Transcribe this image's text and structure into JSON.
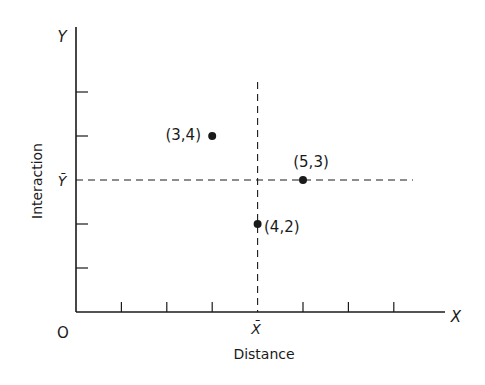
{
  "chart_data": {
    "type": "scatter",
    "title": "",
    "xlabel": "Distance",
    "ylabel": "Interaction",
    "x_axis_symbol": "X",
    "y_axis_symbol": "Y",
    "origin_label": "O",
    "x_mean_label": "X̄",
    "y_mean_label": "Ȳ",
    "x_mean": 4,
    "y_mean": 3,
    "x_ticks": [
      1,
      2,
      3,
      4,
      5,
      6,
      7
    ],
    "y_ticks": [
      1,
      2,
      3,
      4,
      5
    ],
    "xlim": [
      0,
      8.5
    ],
    "ylim": [
      0,
      6.5
    ],
    "grid": false,
    "points": [
      {
        "x": 3,
        "y": 4,
        "label": "(3,4)",
        "label_side": "left"
      },
      {
        "x": 5,
        "y": 3,
        "label": "(5,3)",
        "label_side": "above"
      },
      {
        "x": 4,
        "y": 2,
        "label": "(4,2)",
        "label_side": "right"
      }
    ],
    "reference_lines": [
      {
        "orientation": "vertical",
        "at": "x_mean",
        "style": "dashed"
      },
      {
        "orientation": "horizontal",
        "at": "y_mean",
        "style": "dashed"
      }
    ]
  },
  "labels": {
    "y_axis": "Y",
    "x_axis": "X",
    "origin": "O",
    "x_bar": "X̄",
    "y_bar": "Ȳ",
    "xlabel": "Distance",
    "ylabel": "Interaction",
    "p1": "(3,4)",
    "p2": "(5,3)",
    "p3": "(4,2)"
  },
  "colors": {
    "ink": "#1a1a1a",
    "background": "#ffffff"
  }
}
